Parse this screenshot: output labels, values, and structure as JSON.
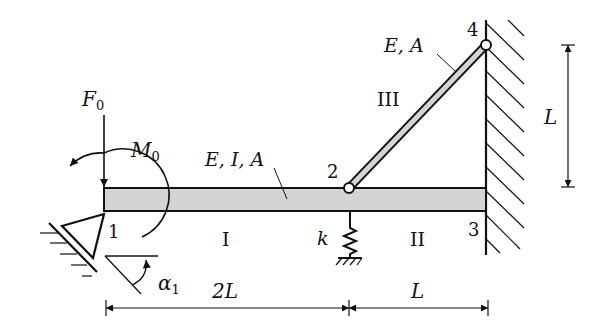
{
  "diagram": {
    "type": "structural-mechanics",
    "colors": {
      "stroke": "#111111",
      "beam_fill": "#d4d4d4",
      "background": "#ffffff"
    },
    "loads": {
      "force": {
        "symbol": "F",
        "sub": "0"
      },
      "moment": {
        "symbol": "M",
        "sub": "0"
      }
    },
    "members": {
      "beam_props": "E, I, A",
      "bar_props": "E, A",
      "segment_I": "I",
      "segment_II": "II",
      "segment_III": "III"
    },
    "nodes": {
      "n1": "1",
      "n2": "2",
      "n3": "3",
      "n4": "4"
    },
    "spring": {
      "symbol": "k"
    },
    "angle": {
      "symbol": "α",
      "sub": "1"
    },
    "dimensions": {
      "span_left": "2L",
      "span_right": "L",
      "height": "L"
    }
  }
}
